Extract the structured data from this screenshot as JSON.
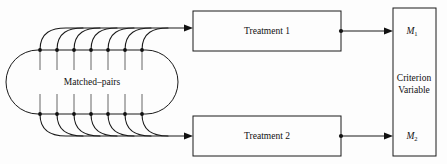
{
  "figure": {
    "background_color": "#fdfdfd",
    "stroke_color": "#1a1a1a",
    "text_color": "#111111"
  },
  "group": {
    "label": "Matched–pairs",
    "pair_count": 7,
    "shape": "stadium-oval"
  },
  "treatments": [
    {
      "id": "treatment-1",
      "label": "Treatment 1"
    },
    {
      "id": "treatment-2",
      "label": "Treatment 2"
    }
  ],
  "criterion": {
    "line1": "Criterion",
    "line2": "Variable",
    "measures": [
      {
        "id": "measure-1",
        "base": "M",
        "subscript": "1"
      },
      {
        "id": "measure-2",
        "base": "M",
        "subscript": "2"
      }
    ]
  }
}
